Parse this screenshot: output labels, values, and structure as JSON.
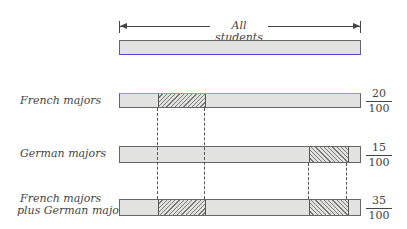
{
  "header": {
    "label": "All students"
  },
  "rows": [
    {
      "label": "French majors",
      "numerator": "20",
      "denominator": "100"
    },
    {
      "label": "German majors",
      "numerator": "15",
      "denominator": "100"
    },
    {
      "label_line1": "French majors",
      "label_line2": "plus German majors",
      "numerator": "35",
      "denominator": "100"
    }
  ],
  "colors": {
    "bar_fill": "#e2e2e0",
    "outline": "#666666",
    "top_bar_bottom_edge": "#5a3cd8",
    "french_bar_top_edge": "#6cc26c"
  }
}
